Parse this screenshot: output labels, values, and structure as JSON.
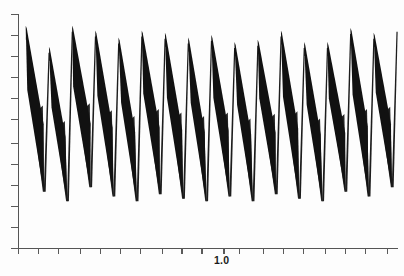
{
  "figure": {
    "background_color": "#fdfdfd",
    "ink_color": "#111111",
    "axis_color": "#555555",
    "width": 404,
    "height": 276
  },
  "axes": {
    "x_axis": {
      "name": "x-axis",
      "tick_count": 19,
      "tick_labels": [
        {
          "value": "1.0",
          "x_px": 224
        }
      ]
    },
    "y_axis": {
      "name": "y-axis",
      "tick_count": 12,
      "tick_labels": []
    }
  },
  "chart_data": {
    "type": "line",
    "title": "",
    "subtitle": "",
    "xlabel": "",
    "ylabel": "",
    "grid": false,
    "legend": null,
    "legend_position": "none",
    "annotations": [],
    "xlim": [
      0.0,
      1.72
    ],
    "ylim": [
      0.0,
      1.0
    ],
    "x_tick_values": [
      0.0,
      0.09,
      0.18,
      0.28,
      0.37,
      0.46,
      0.55,
      0.65,
      0.74,
      0.83,
      0.93,
      1.0,
      1.11,
      1.2,
      1.29,
      1.39,
      1.48,
      1.57,
      1.67
    ],
    "labeled_x_ticks": [
      "1.0"
    ],
    "y_tick_values": [
      0.0,
      0.09,
      0.18,
      0.27,
      0.36,
      0.45,
      0.55,
      0.64,
      0.73,
      0.82,
      0.91,
      1.0
    ],
    "cycles": 16,
    "period_x": 0.105,
    "first_peak_x": 0.035,
    "series": [
      {
        "name": "oscillation envelope upper",
        "values": [
          0.95,
          0.86,
          0.95,
          0.93,
          0.9,
          0.93,
          0.92,
          0.9,
          0.91,
          0.88,
          0.89,
          0.93,
          0.88,
          0.88,
          0.94,
          0.92
        ]
      },
      {
        "name": "oscillation envelope lower",
        "values": [
          0.24,
          0.2,
          0.26,
          0.22,
          0.2,
          0.23,
          0.21,
          0.2,
          0.22,
          0.2,
          0.23,
          0.21,
          0.2,
          0.24,
          0.22,
          0.26
        ]
      },
      {
        "name": "band thickness mid-cycle",
        "values": [
          0.14,
          0.12,
          0.15,
          0.13,
          0.12,
          0.14,
          0.13,
          0.12,
          0.13,
          0.12,
          0.14,
          0.13,
          0.12,
          0.14,
          0.13,
          0.13
        ]
      }
    ]
  }
}
